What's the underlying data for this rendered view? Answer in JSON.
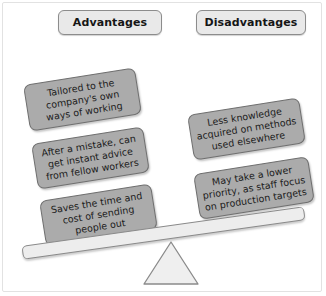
{
  "diagram": {
    "title_left": "Advantages",
    "title_right": "Disadvantages",
    "advantages": [
      "Tailored to the company's own ways of working",
      "After a mistake, can get instant advice from fellow workers",
      "Saves the time and cost of sending people out"
    ],
    "disadvantages": [
      "Less knowledge acquired on methods used elsewhere",
      "May take a lower priority, as staff focus on production targets"
    ],
    "colors": {
      "box_fill": "#ababab",
      "box_border": "#6f6f6f",
      "header_fill": "#e9e9e9",
      "header_border": "#8c8c8c",
      "beam_fill": "#ededed",
      "fulcrum_fill": "#efefef",
      "fulcrum_stroke": "#8a8a8a",
      "background": "#ffffff"
    }
  }
}
